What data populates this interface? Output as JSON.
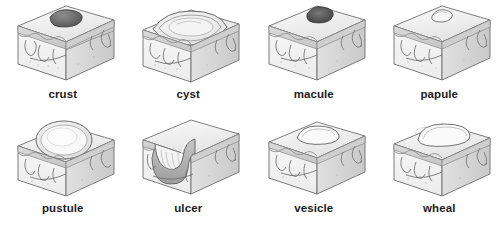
{
  "figure": {
    "style": "grayscale medical cross-section illustrations",
    "columns": 4,
    "rows": 2,
    "background_color": "#ffffff",
    "label_color": "#1c1c1c",
    "ink_color": "#555555",
    "fill_light": "#f2f2f2",
    "fill_mid": "#d9d9d9",
    "fill_dark": "#9a9a9a"
  },
  "lesions": [
    {
      "id": "crust",
      "label": "crust",
      "description": "dark irregular dried exudate plaque sitting on the skin surface"
    },
    {
      "id": "cyst",
      "label": "cyst",
      "description": "large lens-shaped encapsulated cavity elevating the epidermis"
    },
    {
      "id": "macule",
      "label": "macule",
      "description": "flat dark circumscribed discoloration of the skin surface"
    },
    {
      "id": "papule",
      "label": "papule",
      "description": "small solid raised bump elevating the skin surface"
    },
    {
      "id": "pustule",
      "label": "pustule",
      "description": "raised dome-shaped lesion filled with pale purulent fluid"
    },
    {
      "id": "ulcer",
      "label": "ulcer",
      "description": "deep crater-like depression eroding through the epidermis into the dermis"
    },
    {
      "id": "vesicle",
      "label": "vesicle",
      "description": "small fluid-filled blister raised on the skin surface"
    },
    {
      "id": "wheal",
      "label": "wheal",
      "description": "broad flat-topped raised plaque of dermal edema"
    }
  ]
}
